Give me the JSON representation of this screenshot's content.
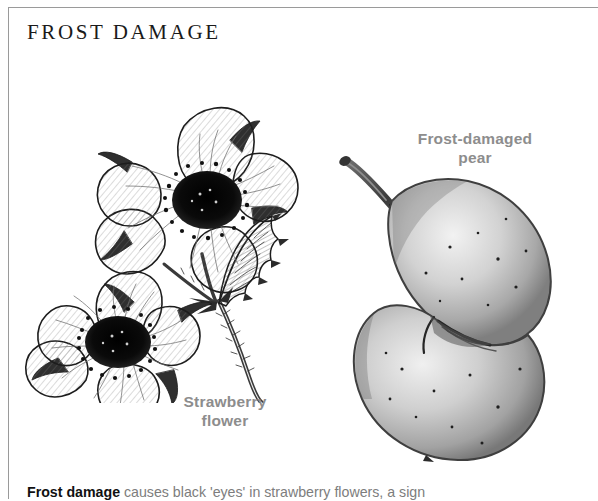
{
  "page": {
    "background_color": "#ffffff",
    "rule_color": "#9a9a9a"
  },
  "heading": {
    "text": "FROST DAMAGE",
    "color": "#1a1a1a"
  },
  "labels": {
    "strawberry": {
      "line1": "Strawberry",
      "line2": "flower",
      "color": "#8d8d8d"
    },
    "pear": {
      "line1": "Frost-damaged",
      "line2": "pear",
      "color": "#8d8d8d"
    }
  },
  "caption": {
    "lead": "Frost damage",
    "rest": " causes black 'eyes' in strawberry flowers, a sign",
    "lead_color": "#111111",
    "body_color": "#7d7d7d"
  },
  "illustrations": {
    "strawberry": {
      "name": "strawberry-flower-line-drawing",
      "style": "pen-and-ink hatched botanical line drawing",
      "elements": [
        "upper five-petalled flower with black frost-damaged centre",
        "lower five-petalled flower with black frost-damaged centre",
        "serrated trifoliate leaf",
        "hairy diagonal stem with sepals"
      ],
      "ink_color": "#1d1d1d"
    },
    "pear": {
      "name": "frost-damaged-pear-stipple-drawing",
      "style": "grayscale stippled tonal drawing",
      "elements": [
        "lumpy deformed pear body with indented left waist",
        "curved woody stem at upper left",
        "russeted stipple speckling over skin"
      ],
      "body_color": "#b4b4b4",
      "highlight_color": "#efefef",
      "outline_color": "#4a4a4a"
    }
  }
}
